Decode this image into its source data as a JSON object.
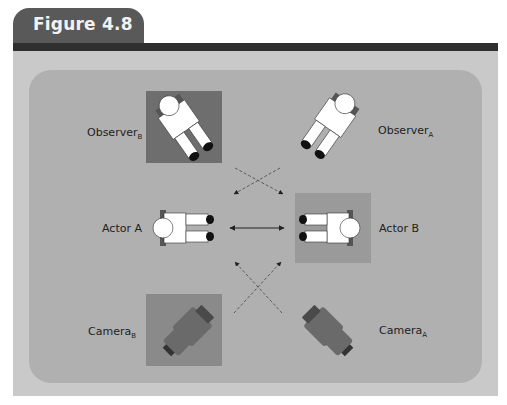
{
  "figure": {
    "title": "Figure 4.8"
  },
  "labels": {
    "observer_b": {
      "text": "Observer",
      "sub": "B"
    },
    "observer_a": {
      "text": "Observer",
      "sub": "A"
    },
    "actor_a": {
      "text": "Actor A"
    },
    "actor_b": {
      "text": "Actor B"
    },
    "camera_b": {
      "text": "Camera",
      "sub": "B"
    },
    "camera_a": {
      "text": "Camera",
      "sub": "A"
    }
  },
  "colors": {
    "tab": "#595959",
    "bar": "#2f2f2f",
    "frame": "#c9c9c9",
    "panel": "#b0b0b0",
    "observer_b_square": "#6e6e6e",
    "actor_b_square": "#9a9a9a",
    "camera_b_square": "#8a8a8a",
    "camera_body": "#6a6a6a"
  }
}
